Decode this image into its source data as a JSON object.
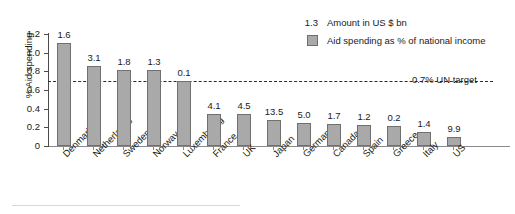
{
  "chart_data": {
    "type": "bar",
    "title": "",
    "subtitle": "",
    "xlabel": "",
    "ylabel": "% Aid spending",
    "ylim": [
      0,
      1.2
    ],
    "grid": false,
    "legend_position": "top-right",
    "categories": [
      "Denmark",
      "Netherlands",
      "Sweden",
      "Norway",
      "Luxembourg",
      "France",
      "UK",
      "Japan",
      "Germany",
      "Canada",
      "Spain",
      "Greece",
      "Italy",
      "US"
    ],
    "values": [
      1.1,
      0.86,
      0.81,
      0.81,
      0.7,
      0.34,
      0.34,
      0.28,
      0.25,
      0.24,
      0.23,
      0.21,
      0.15,
      0.1
    ],
    "point_labels": [
      "1.6",
      "3.1",
      "1.8",
      "1.3",
      "0.1",
      "4.1",
      "4.5",
      "13.5",
      "5.0",
      "1.7",
      "1.2",
      "0.2",
      "1.4",
      "9.9"
    ],
    "ytick_labels": [
      "1.2",
      "1.0",
      "0.8",
      "0.6",
      "0.4",
      "0.2",
      "0"
    ],
    "ytick_values": [
      1.2,
      1.0,
      0.8,
      0.6,
      0.4,
      0.2,
      0
    ],
    "series": [
      {
        "name": "Aid spending as % of national income",
        "values": [
          1.1,
          0.86,
          0.81,
          0.81,
          0.7,
          0.34,
          0.34,
          0.28,
          0.25,
          0.24,
          0.23,
          0.21,
          0.15,
          0.1
        ]
      },
      {
        "name": "Amount in US $ bn",
        "values": [
          1.6,
          3.1,
          1.8,
          1.3,
          0.1,
          4.1,
          4.5,
          13.5,
          5.0,
          1.7,
          1.2,
          0.2,
          1.4,
          9.9
        ]
      }
    ],
    "annotations": [
      {
        "type": "hline",
        "value": 0.7,
        "label": "0.7% UN target",
        "style": "dashed"
      }
    ],
    "colors": {
      "bar_fill": "#a9a9a9",
      "bar_stroke": "#707070",
      "axis": "#4a4a4a",
      "text": "#1a1a1a",
      "target_line": "#2b2b2b"
    }
  },
  "legend": {
    "rows": [
      {
        "key": "1.3",
        "label": "Amount in US $ bn",
        "swatch": false
      },
      {
        "key": "",
        "label": "Aid spending as % of national income",
        "swatch": true
      }
    ]
  },
  "axes": {
    "y_title": "% Aid spending"
  },
  "target": {
    "label": "0.7% UN target"
  }
}
